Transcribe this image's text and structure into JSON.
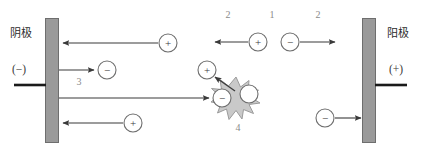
{
  "diagram": {
    "width": 421,
    "height": 152,
    "background_color": "#ffffff"
  },
  "colors": {
    "plate_fill": "#9a9a9a",
    "plate_stroke": "#6e6e6e",
    "arrow": "#3a3a3a",
    "text": "#2b2b2b",
    "index_label": "#8a8a8a",
    "burst_fill": "#c9c9c9",
    "burst_stroke": "#9b9b9b",
    "circle_stroke": "#6e6e6e",
    "wire": "#1a1a1a"
  },
  "electrodes": {
    "cathode": {
      "name_label": "阴极",
      "polarity_label": "(−)"
    },
    "anode": {
      "name_label": "阳极",
      "polarity_label": "(+)"
    }
  },
  "index_labels": {
    "top_left": "2",
    "top_middle": "1",
    "top_right": "2",
    "cathode_emission": "3",
    "burst": "4"
  },
  "particles": {
    "positive_symbol": "+",
    "negative_symbol": "−",
    "items": [
      {
        "id": "ion-top-incoming",
        "sign": "+",
        "x": 168,
        "y": 43
      },
      {
        "id": "ion-mid-left-moving",
        "sign": "+",
        "x": 258,
        "y": 42
      },
      {
        "id": "electron-mid-right-moving",
        "sign": "−",
        "x": 290,
        "y": 42
      },
      {
        "id": "electron-emitted",
        "sign": "−",
        "x": 107,
        "y": 70
      },
      {
        "id": "ion-ejected-from-burst",
        "sign": "+",
        "x": 207,
        "y": 70
      },
      {
        "id": "electron-entering-burst",
        "sign": "−",
        "x": 222,
        "y": 98
      },
      {
        "id": "neutral-particle",
        "sign": "",
        "x": 249,
        "y": 94
      },
      {
        "id": "ion-bottom-incoming",
        "sign": "+",
        "x": 133,
        "y": 123
      },
      {
        "id": "electron-to-anode",
        "sign": "−",
        "x": 325,
        "y": 118
      }
    ]
  },
  "arrows": [
    {
      "id": "ion-to-cathode-top",
      "from_x": 158,
      "from_y": 43,
      "to_x": 61,
      "to_y": 43,
      "direction": "left"
    },
    {
      "id": "electron-emission-from-cathode",
      "from_x": 59,
      "from_y": 70,
      "to_x": 96,
      "to_y": 70,
      "direction": "right"
    },
    {
      "id": "electron-travel-to-burst",
      "from_x": 59,
      "from_y": 98,
      "to_x": 210,
      "to_y": 98,
      "direction": "right"
    },
    {
      "id": "ion-to-cathode-bottom",
      "from_x": 123,
      "from_y": 123,
      "to_x": 61,
      "to_y": 123,
      "direction": "left"
    },
    {
      "id": "ion-moving-left-middle",
      "from_x": 248,
      "from_y": 42,
      "to_x": 214,
      "to_y": 42,
      "direction": "left"
    },
    {
      "id": "electron-moving-right-middle",
      "from_x": 300,
      "from_y": 42,
      "to_x": 336,
      "to_y": 42,
      "direction": "right"
    },
    {
      "id": "ion-ejection-from-burst",
      "from_x": 234,
      "from_y": 90,
      "to_x": 214,
      "to_y": 76,
      "direction": "up-left"
    },
    {
      "id": "electron-to-anode-arrow",
      "from_x": 335,
      "from_y": 118,
      "to_x": 362,
      "to_y": 118,
      "direction": "right"
    }
  ],
  "burst": {
    "id": "collision-burst",
    "center_x": 236,
    "center_y": 97,
    "label": "4"
  },
  "wires": {
    "cathode_lead": {
      "x1": 14,
      "y1": 85,
      "x2": 46,
      "y2": 85
    },
    "anode_lead": {
      "x1": 375,
      "y1": 85,
      "x2": 407,
      "y2": 85
    }
  }
}
